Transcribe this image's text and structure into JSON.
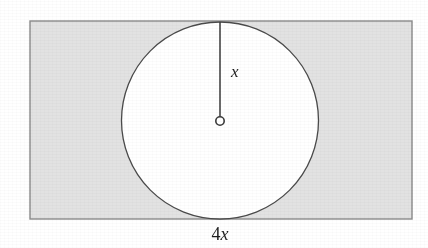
{
  "figure": {
    "name": "circle-inscribed-in-rectangle",
    "background_color": "#ffffff",
    "canvas": {
      "width": 428,
      "height": 248
    }
  },
  "rectangle": {
    "label": "rectangle",
    "x": 30,
    "y": 21,
    "width": 382,
    "height": 198,
    "fill_color": "#e2e2e2",
    "stroke_color": "#8a8a8a",
    "stroke_width": 1.4
  },
  "circle": {
    "label": "circle",
    "center_x": 220,
    "center_y": 120.5,
    "radius": 98.5,
    "fill_color": "#ffffff",
    "stroke_color": "#4a4a4a",
    "stroke_width": 1.3
  },
  "center_marker": {
    "label": "center-point",
    "x": 220,
    "y": 121,
    "radius": 4.2,
    "fill_color": "#ffffff",
    "stroke_color": "#3a3a3a",
    "stroke_width": 1.6
  },
  "radius_segment": {
    "label": "radius-segment",
    "x1": 220,
    "y1": 117,
    "x2": 220,
    "y2": 22,
    "stroke_color": "#3a3a3a",
    "stroke_width": 1.5
  },
  "labels": {
    "radius": {
      "text": "x",
      "x": 231,
      "y": 77,
      "font_size": 17,
      "style": "italic",
      "meaning": "radius of the circle"
    },
    "width": {
      "prefix": "4",
      "variable": "x",
      "text": "4x",
      "x": 220,
      "y": 240,
      "font_size": 18,
      "meaning": "width of the rectangle"
    }
  },
  "chart_data": {
    "type": "diagram",
    "title": "",
    "shapes": [
      {
        "shape": "rectangle",
        "fill": "shaded",
        "width_label": "4x",
        "height_label": "2x",
        "width_value_in_x": 4,
        "height_value_in_x": 2
      },
      {
        "shape": "circle",
        "fill": "white",
        "radius_label": "x",
        "radius_value_in_x": 1,
        "relationship": "inscribed vertically; touches top and bottom edges of the rectangle"
      }
    ],
    "annotations": [
      "x",
      "4x"
    ]
  }
}
